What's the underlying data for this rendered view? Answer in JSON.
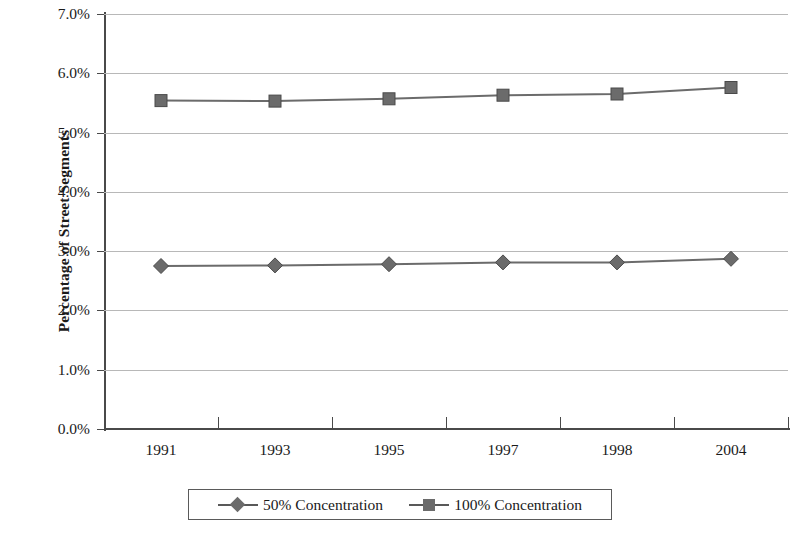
{
  "chart_data": {
    "type": "line",
    "title": "",
    "xlabel": "",
    "ylabel": "Percentage of Street Segments",
    "categories": [
      "1991",
      "1993",
      "1995",
      "1997",
      "1998",
      "2004"
    ],
    "ylim": [
      0.0,
      7.0
    ],
    "ytick_labels": [
      "0.0%",
      "1.0%",
      "2.0%",
      "3.0%",
      "4.0%",
      "5.0%",
      "6.0%",
      "7.0%"
    ],
    "ytick_values": [
      0.0,
      1.0,
      2.0,
      3.0,
      4.0,
      5.0,
      6.0,
      7.0
    ],
    "grid": true,
    "legend_position": "bottom",
    "series": [
      {
        "name": "50% Concentration",
        "marker": "diamond",
        "color": "#6b6b6b",
        "values": [
          2.75,
          2.76,
          2.78,
          2.81,
          2.81,
          2.87
        ]
      },
      {
        "name": "100% Concentration",
        "marker": "square",
        "color": "#6b6b6b",
        "values": [
          5.54,
          5.53,
          5.57,
          5.63,
          5.65,
          5.76
        ]
      }
    ]
  },
  "legend": {
    "items": [
      {
        "label": "50% Concentration",
        "marker": "diamond-marker"
      },
      {
        "label": "100% Concentration",
        "marker": "square-marker"
      }
    ]
  },
  "colors": {
    "series": "#6b6b6b",
    "axis": "#4a4a4a",
    "gridline": "#b8b8b8",
    "background": "#ffffff"
  }
}
